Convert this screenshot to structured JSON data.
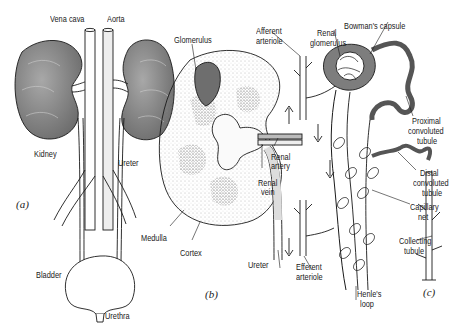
{
  "figure": {
    "panels": [
      {
        "id": "a",
        "label": "(a)"
      },
      {
        "id": "b",
        "label": "(b)"
      },
      {
        "id": "c",
        "label": "(c)"
      }
    ],
    "panel_a": {
      "vena_cava": "Vena cava",
      "aorta": "Aorta",
      "kidney": "Kidney",
      "ureter": "Ureter",
      "bladder": "Bladder",
      "urethra": "Urethra"
    },
    "panel_b": {
      "glomerulus": "Glomerulus",
      "renal_artery_1": "Renal",
      "renal_artery_2": "artery",
      "renal_vein_1": "Renal",
      "renal_vein_2": "vein",
      "medulla": "Medulla",
      "cortex": "Cortex",
      "ureter": "Ureter"
    },
    "panel_c": {
      "afferent_1": "Afferent",
      "afferent_2": "arteriole",
      "renal_glom_1": "Renal",
      "renal_glom_2": "glomerulus",
      "bowmans": "Bowman's capsule",
      "proximal_1": "Proximal",
      "proximal_2": "convoluted",
      "proximal_3": "tubule",
      "distal_1": "Distal",
      "distal_2": "convoluted",
      "distal_3": "tubule",
      "capillary_1": "Capillary",
      "capillary_2": "net",
      "collecting_1": "Collecting",
      "collecting_2": "tubule",
      "efferent_1": "Efferent",
      "efferent_2": "arteriole",
      "henle_1": "Henle's",
      "henle_2": "loop"
    },
    "colors": {
      "kidney_fill": "#8a8a8a",
      "line": "#1a1a1a",
      "stipple": "#9a9a9a",
      "tubule_fill": "#7d7d7d"
    }
  }
}
